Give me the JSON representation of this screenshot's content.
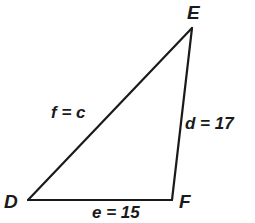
{
  "diagram": {
    "type": "triangle",
    "name": "triangle-DEF",
    "background_color": "#ffffff",
    "stroke_color": "#1a1a1a",
    "stroke_width": 2.2,
    "vertices": [
      {
        "id": "D",
        "label": "D",
        "x": 28,
        "y": 200
      },
      {
        "id": "E",
        "label": "E",
        "x": 192,
        "y": 28
      },
      {
        "id": "F",
        "label": "F",
        "x": 172,
        "y": 200
      }
    ],
    "sides": [
      {
        "id": "f",
        "label": "f = c",
        "from": "D",
        "to": "E",
        "value": "c"
      },
      {
        "id": "d",
        "label": "d = 17",
        "from": "E",
        "to": "F",
        "value": "17"
      },
      {
        "id": "e",
        "label": "e = 15",
        "from": "D",
        "to": "F",
        "value": "15"
      }
    ]
  }
}
